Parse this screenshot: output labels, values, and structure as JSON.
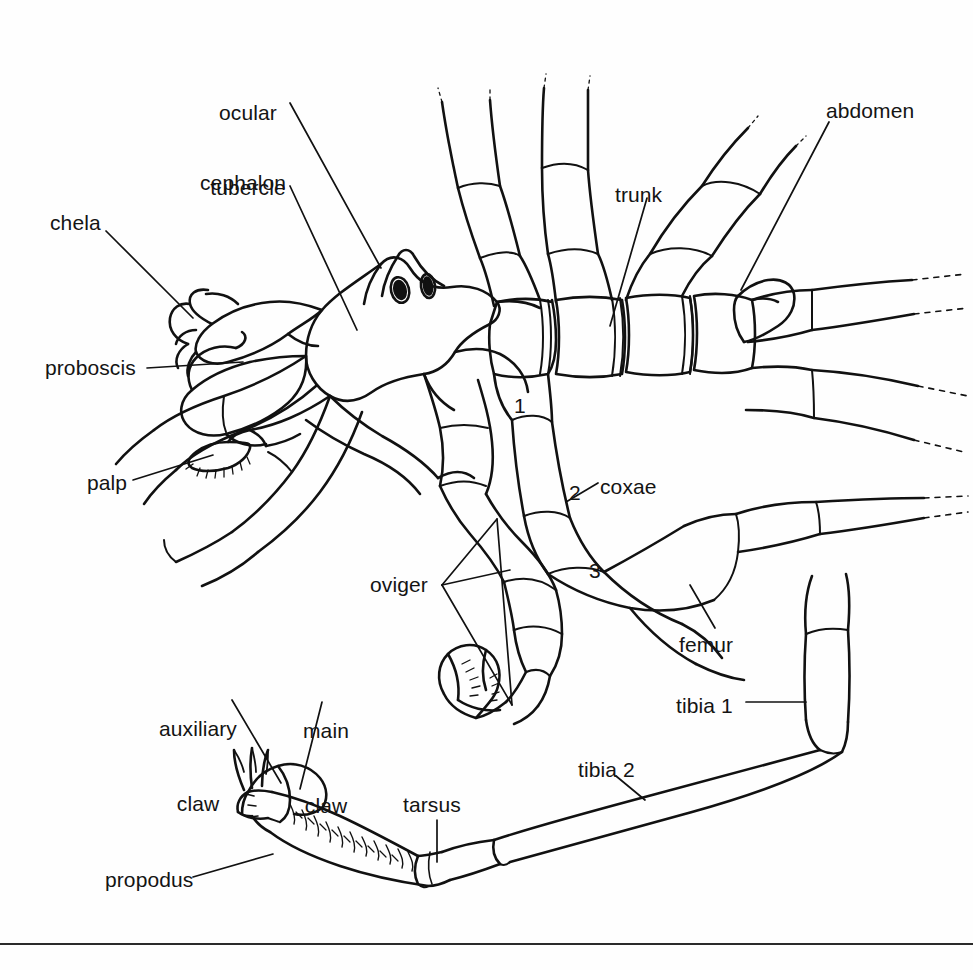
{
  "figure": {
    "view": "dorsal",
    "line_color": "#111111",
    "background_color": "#fefefe",
    "has_bottom_rule": true
  },
  "labels": [
    {
      "id": "ocular-tubercle",
      "text": "ocular\ntubercle",
      "line1": "ocular",
      "line2": "tubercle",
      "x": 205,
      "y": 50,
      "align": "center"
    },
    {
      "id": "cephalon",
      "text": "cephalon",
      "line1": "cephalon",
      "line2": "",
      "x": 200,
      "y": 170,
      "align": "left"
    },
    {
      "id": "chela",
      "text": "chela",
      "line1": "chela",
      "line2": "",
      "x": 50,
      "y": 210,
      "align": "left"
    },
    {
      "id": "proboscis",
      "text": "proboscis",
      "line1": "proboscis",
      "line2": "",
      "x": 45,
      "y": 355,
      "align": "left"
    },
    {
      "id": "palp",
      "text": "palp",
      "line1": "palp",
      "line2": "",
      "x": 87,
      "y": 470,
      "align": "left"
    },
    {
      "id": "oviger",
      "text": "oviger",
      "line1": "oviger",
      "line2": "",
      "x": 370,
      "y": 572,
      "align": "left"
    },
    {
      "id": "trunk",
      "text": "trunk",
      "line1": "trunk",
      "line2": "",
      "x": 615,
      "y": 182,
      "align": "left"
    },
    {
      "id": "abdomen",
      "text": "abdomen",
      "line1": "abdomen",
      "line2": "",
      "x": 826,
      "y": 98,
      "align": "left"
    },
    {
      "id": "coxae",
      "text": "coxae",
      "line1": "coxae",
      "line2": "",
      "x": 600,
      "y": 474,
      "align": "left"
    },
    {
      "id": "coxa-1",
      "text": "1",
      "line1": "1",
      "line2": "",
      "x": 514,
      "y": 393,
      "align": "left"
    },
    {
      "id": "coxa-2",
      "text": "2",
      "line1": "2",
      "line2": "",
      "x": 569,
      "y": 480,
      "align": "left"
    },
    {
      "id": "coxa-3",
      "text": "3",
      "line1": "3",
      "line2": "",
      "x": 589,
      "y": 558,
      "align": "left"
    },
    {
      "id": "femur",
      "text": "femur",
      "line1": "femur",
      "line2": "",
      "x": 679,
      "y": 632,
      "align": "left"
    },
    {
      "id": "tibia-1",
      "text": "tibia 1",
      "line1": "tibia 1",
      "line2": "",
      "x": 676,
      "y": 693,
      "align": "left"
    },
    {
      "id": "tibia-2",
      "text": "tibia 2",
      "line1": "tibia 2",
      "line2": "",
      "x": 578,
      "y": 757,
      "align": "left"
    },
    {
      "id": "auxiliary-claw",
      "text": "auxiliary\nclaw",
      "line1": "auxiliary",
      "line2": "claw",
      "x": 154,
      "y": 666,
      "align": "center"
    },
    {
      "id": "main-claw",
      "text": "main\nclaw",
      "line1": "main",
      "line2": "claw",
      "x": 299,
      "y": 668,
      "align": "center"
    },
    {
      "id": "tarsus",
      "text": "tarsus",
      "line1": "tarsus",
      "line2": "",
      "x": 403,
      "y": 792,
      "align": "left"
    },
    {
      "id": "propodus",
      "text": "propodus",
      "line1": "propodus",
      "line2": "",
      "x": 105,
      "y": 867,
      "align": "left"
    }
  ],
  "body_parts": [
    "cephalon",
    "ocular tubercle",
    "trunk",
    "abdomen",
    "proboscis",
    "chela",
    "palp",
    "oviger",
    "coxae",
    "femur",
    "tibia 1",
    "tibia 2",
    "tarsus",
    "propodus",
    "main claw",
    "auxiliary claw"
  ]
}
